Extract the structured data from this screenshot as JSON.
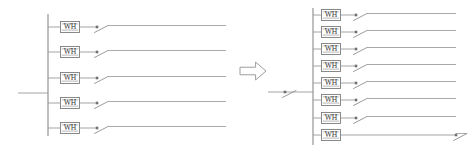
{
  "figure": {
    "background_color": "#ffffff",
    "line_color": "#9a9a9a",
    "bus_color": "#8a8a8a",
    "text_color": "#3a3a3a",
    "width": 475,
    "height": 153
  },
  "left_panel": {
    "name": "before-configuration",
    "feeder_count": 5,
    "bus": {
      "x": 48,
      "y_top": 14,
      "y_bottom": 136,
      "label": "vertical-busbar"
    },
    "incoming_feed": {
      "x_start": 18,
      "x_end": 48,
      "y": 93,
      "label": "incoming-supply-line"
    },
    "feeders": [
      {
        "index": 1,
        "y": 27,
        "meter_label": "WH",
        "branch_x_start": 48,
        "meter_x": 70,
        "switch_x": 97,
        "line_x_end": 226
      },
      {
        "index": 2,
        "y": 52,
        "meter_label": "WH",
        "branch_x_start": 48,
        "meter_x": 70,
        "switch_x": 97,
        "line_x_end": 226
      },
      {
        "index": 3,
        "y": 78,
        "meter_label": "WH",
        "branch_x_start": 48,
        "meter_x": 70,
        "switch_x": 97,
        "line_x_end": 226
      },
      {
        "index": 4,
        "y": 103,
        "meter_label": "WH",
        "branch_x_start": 48,
        "meter_x": 70,
        "switch_x": 97,
        "line_x_end": 226
      },
      {
        "index": 5,
        "y": 128,
        "meter_label": "WH",
        "branch_x_start": 48,
        "meter_x": 70,
        "switch_x": 97,
        "line_x_end": 226
      }
    ]
  },
  "transform_arrow": {
    "name": "transformation-arrow",
    "direction": "right",
    "x": 240,
    "y": 62,
    "width": 26,
    "height": 18
  },
  "right_panel": {
    "name": "after-configuration",
    "feeder_count": 8,
    "bus": {
      "x": 313,
      "y_top": 8,
      "y_bottom": 145,
      "label": "vertical-busbar"
    },
    "incoming_feed": {
      "x_start": 268,
      "x_end": 313,
      "y": 92,
      "label": "incoming-supply-line",
      "has_switch": true,
      "switch_x": 285
    },
    "feeders": [
      {
        "index": 1,
        "y": 15,
        "meter_label": "WH",
        "branch_x_start": 313,
        "meter_x": 331,
        "switch_x": 356,
        "line_x_end": 456
      },
      {
        "index": 2,
        "y": 32,
        "meter_label": "WH",
        "branch_x_start": 313,
        "meter_x": 331,
        "switch_x": 356,
        "line_x_end": 456
      },
      {
        "index": 3,
        "y": 49,
        "meter_label": "WH",
        "branch_x_start": 313,
        "meter_x": 331,
        "switch_x": 356,
        "line_x_end": 456
      },
      {
        "index": 4,
        "y": 66,
        "meter_label": "WH",
        "branch_x_start": 313,
        "meter_x": 331,
        "switch_x": 356,
        "line_x_end": 456
      },
      {
        "index": 5,
        "y": 83,
        "meter_label": "WH",
        "branch_x_start": 313,
        "meter_x": 331,
        "switch_x": 356,
        "line_x_end": 456
      },
      {
        "index": 6,
        "y": 100,
        "meter_label": "WH",
        "branch_x_start": 313,
        "meter_x": 331,
        "switch_x": 356,
        "line_x_end": 456
      },
      {
        "index": 7,
        "y": 118,
        "meter_label": "WH",
        "branch_x_start": 313,
        "meter_x": 331,
        "switch_x": 356,
        "line_x_end": 456
      },
      {
        "index": 8,
        "y": 135,
        "meter_label": "WH",
        "branch_x_start": 313,
        "meter_x": 331,
        "switch_x": 456,
        "line_x_end": 456
      }
    ]
  }
}
